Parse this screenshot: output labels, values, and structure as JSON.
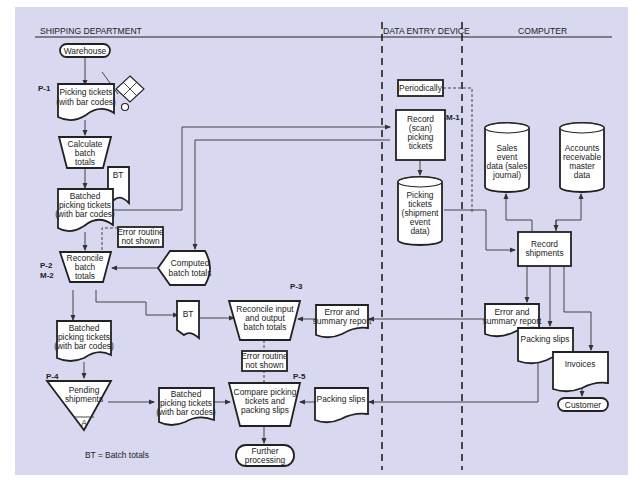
{
  "lanes": [
    {
      "label": "SHIPPING DEPARTMENT"
    },
    {
      "label": "DATA ENTRY DEVICE"
    },
    {
      "label": "COMPUTER"
    }
  ],
  "labels": {
    "p1": "P-1",
    "p2": "P-2",
    "m2": "M-2",
    "m1": "M-1",
    "p3": "P-3",
    "p4": "P-4",
    "p5": "P-5"
  },
  "nodes": {
    "warehouse": "Warehouse",
    "picking_tickets": [
      "Picking tickets",
      "(with bar codes)"
    ],
    "calculate_batch": [
      "Calculate",
      "batch",
      "totals"
    ],
    "bt_doc_1": "BT",
    "batched_tickets_1": [
      "Batched",
      "picking tickets",
      "(with bar codes)"
    ],
    "error_routine_1": [
      "Error routine",
      "not shown"
    ],
    "reconcile_batch": [
      "Reconcile",
      "batch",
      "totals"
    ],
    "computed_batch": [
      "Computed",
      "batch totals"
    ],
    "batched_tickets_2": [
      "Batched",
      "picking tickets",
      "(with bar codes)"
    ],
    "bt_doc_2": "BT",
    "reconcile_io": [
      "Reconcile input",
      "and output",
      "batch totals"
    ],
    "error_summary_1": [
      "Error and",
      "summary report"
    ],
    "error_routine_2": [
      "Error routine",
      "not shown"
    ],
    "pending_shipments": [
      "Pending",
      "shipments"
    ],
    "pending_file_letter": "A",
    "batched_tickets_3": [
      "Batched",
      "picking tickets",
      "(with bar codes)"
    ],
    "compare": [
      "Compare picking",
      "tickets and",
      "packing slips"
    ],
    "packing_slips_1": "Packing slips",
    "further_processing": [
      "Further",
      "processing"
    ],
    "periodically": "Periodically",
    "record_scan": [
      "Record",
      "(scan)",
      "picking",
      "tickets"
    ],
    "picking_db": [
      "Picking",
      "tickets",
      "(shipment",
      "event",
      "data)"
    ],
    "sales_db": [
      "Sales",
      "event",
      "data (sales",
      "journal)"
    ],
    "ar_db": [
      "Accounts",
      "receivable",
      "master",
      "data"
    ],
    "record_shipments": [
      "Record",
      "shipments"
    ],
    "error_summary_2": [
      "Error and",
      "summary report"
    ],
    "packing_slips_2": "Packing slips",
    "invoices": "Invoices",
    "customer": "Customer"
  },
  "legend": "BT = Batch totals",
  "colors": {
    "background": "#d8d8f0",
    "shape_fill": "#ffffff",
    "stroke": "#222222"
  }
}
